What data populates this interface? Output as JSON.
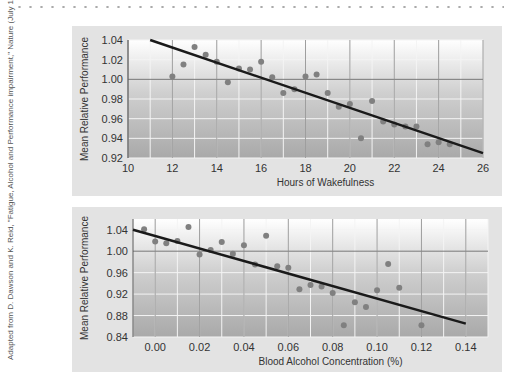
{
  "credit": "Adapted from D. Dawson and K. Reid, \"Fatigue, Alcohol and Performance impairment,\" Nature (July 17, 1997), 235.",
  "chart_data": [
    {
      "type": "scatter",
      "title": "",
      "xlabel": "Hours of Wakefulness",
      "ylabel": "Mean Relative Performance",
      "xlim": [
        10,
        26
      ],
      "ylim": [
        0.92,
        1.04
      ],
      "xticks": [
        "10",
        "12",
        "14",
        "16",
        "18",
        "20",
        "22",
        "24",
        "26"
      ],
      "yticks": [
        "0.92",
        "0.94",
        "0.96",
        "0.98",
        "1.00",
        "1.02",
        "1.04"
      ],
      "x": [
        12,
        12.5,
        13,
        13.5,
        14,
        14.5,
        15,
        15.5,
        16,
        16.5,
        17,
        17.5,
        18,
        18.5,
        19,
        19.5,
        20,
        20.5,
        21,
        21.5,
        22,
        22.5,
        23,
        23.5,
        24,
        24.5
      ],
      "y": [
        1.003,
        1.015,
        1.033,
        1.025,
        1.018,
        0.997,
        1.011,
        1.01,
        1.018,
        1.002,
        0.986,
        0.99,
        1.003,
        1.005,
        0.986,
        0.972,
        0.975,
        0.94,
        0.978,
        0.957,
        0.954,
        0.952,
        0.952,
        0.934,
        0.936,
        0.934
      ],
      "trendline": {
        "x": [
          11,
          26
        ],
        "y": [
          1.04,
          0.925
        ]
      },
      "grid": true
    },
    {
      "type": "scatter",
      "title": "",
      "xlabel": "Blood Alcohol Concentration (%)",
      "ylabel": "Mean Relative Performance",
      "xlim": [
        -0.01,
        0.15
      ],
      "ylim": [
        0.84,
        1.06
      ],
      "xticks": [
        "0.00",
        "0.02",
        "0.04",
        "0.06",
        "0.08",
        "0.10",
        "0.12",
        "0.14"
      ],
      "yticks": [
        "0.84",
        "0.88",
        "0.92",
        "0.96",
        "1.00",
        "1.04"
      ],
      "x": [
        -0.005,
        0.0,
        0.005,
        0.01,
        0.015,
        0.02,
        0.025,
        0.03,
        0.035,
        0.04,
        0.045,
        0.05,
        0.055,
        0.06,
        0.065,
        0.07,
        0.075,
        0.08,
        0.085,
        0.09,
        0.095,
        0.1,
        0.105,
        0.11,
        0.12
      ],
      "y": [
        1.041,
        1.018,
        1.015,
        1.019,
        1.045,
        0.994,
        1.002,
        1.017,
        0.995,
        1.011,
        0.975,
        1.029,
        0.972,
        0.969,
        0.929,
        0.937,
        0.934,
        0.922,
        0.862,
        0.905,
        0.896,
        0.927,
        0.976,
        0.932,
        0.862
      ],
      "trendline": {
        "x": [
          -0.01,
          0.14
        ],
        "y": [
          1.04,
          0.865
        ]
      },
      "grid": true
    }
  ]
}
